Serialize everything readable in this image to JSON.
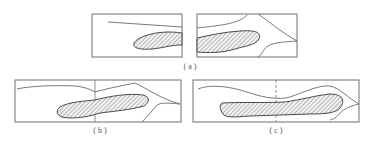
{
  "figure": {
    "panels": [
      {
        "id": "a",
        "label": "( a )",
        "description": "Two separate frames showing lens-shaped hatched body with upper contour line"
      },
      {
        "id": "b",
        "label": "( b )",
        "description": "Combined frame with solid vertical divider through hatched body"
      },
      {
        "id": "c",
        "label": "( c )",
        "description": "Combined frame with dashed vertical divider through elongated hatched body"
      }
    ],
    "colors": {
      "line": "#6e6e6e",
      "hatch": "#6a6a6a",
      "background": "#ffffff"
    }
  }
}
